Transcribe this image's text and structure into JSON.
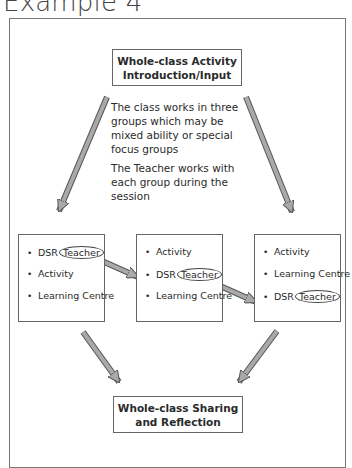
{
  "title": "Example 4",
  "top_box": {
    "line1": "Whole-class Activity",
    "line2": "Introduction/Input"
  },
  "note": {
    "para1": "The class works in three groups which may be mixed ability or special focus groups",
    "para2": "The Teacher works with each group during the session"
  },
  "groups": [
    {
      "items": [
        {
          "label": "DSR",
          "circled": "Teacher"
        },
        {
          "label": "Activity"
        },
        {
          "label": "Learning Centre"
        }
      ]
    },
    {
      "items": [
        {
          "label": "Activity"
        },
        {
          "label": "DSR",
          "circled": "Teacher"
        },
        {
          "label": "Learning Centre"
        }
      ]
    },
    {
      "items": [
        {
          "label": "Activity"
        },
        {
          "label": "Learning Centre"
        },
        {
          "label": "DSR",
          "circled": "Teacher"
        }
      ]
    }
  ],
  "bottom_box": {
    "line1": "Whole-class Sharing",
    "line2": "and Reflection"
  },
  "colors": {
    "arrow_fill": "#a9a9a9",
    "arrow_stroke": "#555555",
    "box_border": "#666666"
  }
}
